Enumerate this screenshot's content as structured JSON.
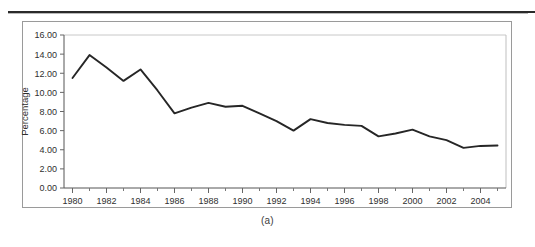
{
  "figure": {
    "caption": "(a)"
  },
  "chart_data": {
    "type": "line",
    "title": "",
    "xlabel": "",
    "ylabel": "Percentage",
    "xlim": [
      1979.5,
      2005.5
    ],
    "ylim": [
      0,
      16
    ],
    "grid": false,
    "legend": null,
    "y_tick_labels": [
      "16.00",
      "14.00",
      "12.00",
      "10.00",
      "8.00",
      "6.00",
      "4.00",
      "2.00",
      "0.00"
    ],
    "y_ticks": [
      16,
      14,
      12,
      10,
      8,
      6,
      4,
      2,
      0
    ],
    "x_tick_labels": [
      "1980",
      "1982",
      "1984",
      "1986",
      "1988",
      "1990",
      "1992",
      "1994",
      "1996",
      "1998",
      "2000",
      "2002",
      "2004"
    ],
    "x_major_ticks": [
      1980,
      1982,
      1984,
      1986,
      1988,
      1990,
      1992,
      1994,
      1996,
      1998,
      2000,
      2002,
      2004
    ],
    "x_minor_ticks": [
      1981,
      1983,
      1985,
      1987,
      1989,
      1991,
      1993,
      1995,
      1997,
      1999,
      2001,
      2003,
      2005
    ],
    "x": [
      1980,
      1981,
      1982,
      1983,
      1984,
      1985,
      1986,
      1987,
      1988,
      1989,
      1990,
      1991,
      1992,
      1993,
      1994,
      1995,
      1996,
      1997,
      1998,
      1999,
      2000,
      2001,
      2002,
      2003,
      2004,
      2005
    ],
    "values": [
      11.5,
      13.9,
      12.6,
      11.2,
      12.4,
      10.2,
      7.8,
      8.4,
      8.9,
      8.5,
      8.6,
      7.8,
      7.0,
      6.0,
      7.2,
      6.8,
      6.6,
      6.5,
      5.4,
      5.7,
      6.1,
      5.4,
      5.0,
      4.2,
      4.4,
      4.45
    ],
    "series": [
      {
        "name": "Percentage",
        "color": "#262626",
        "values": [
          11.5,
          13.9,
          12.6,
          11.2,
          12.4,
          10.2,
          7.8,
          8.4,
          8.9,
          8.5,
          8.6,
          7.8,
          7.0,
          6.0,
          7.2,
          6.8,
          6.6,
          6.5,
          5.4,
          5.7,
          6.1,
          5.4,
          5.0,
          4.2,
          4.4,
          4.45
        ]
      }
    ]
  },
  "colors": {
    "line": "#262626",
    "axis": "#555555",
    "frame": "#9a9a9a",
    "rule": "#2a2a2a"
  }
}
